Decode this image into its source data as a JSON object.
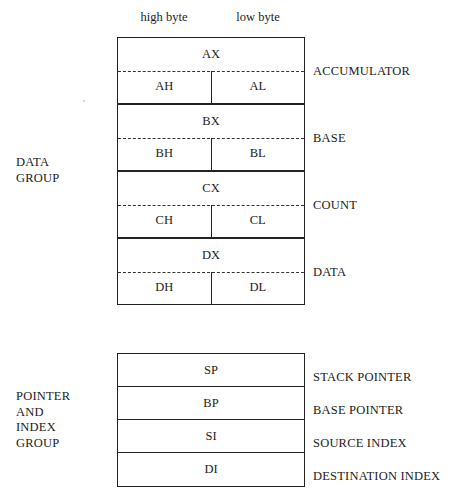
{
  "diagram": {
    "byte_headers": [
      "high byte",
      "low byte"
    ],
    "colors": {
      "line": "#222222",
      "text": "#1c1c1c",
      "background": "#ffffff"
    },
    "data_group": {
      "caption_line1": "DATA",
      "caption_line2": "GROUP",
      "registers": [
        {
          "full": "AX",
          "high": "AH",
          "low": "AL",
          "label": "ACCUMULATOR"
        },
        {
          "full": "BX",
          "high": "BH",
          "low": "BL",
          "label": "BASE"
        },
        {
          "full": "CX",
          "high": "CH",
          "low": "CL",
          "label": "COUNT"
        },
        {
          "full": "DX",
          "high": "DH",
          "low": "DL",
          "label": "DATA"
        }
      ]
    },
    "pointer_index_group": {
      "caption_line1": "POINTER",
      "caption_line2": "AND",
      "caption_line3": "INDEX",
      "caption_line4": "GROUP",
      "registers": [
        {
          "name": "SP",
          "label": "STACK POINTER"
        },
        {
          "name": "BP",
          "label": "BASE POINTER"
        },
        {
          "name": "SI",
          "label": "SOURCE INDEX"
        },
        {
          "name": "DI",
          "label": "DESTINATION INDEX"
        }
      ]
    }
  }
}
